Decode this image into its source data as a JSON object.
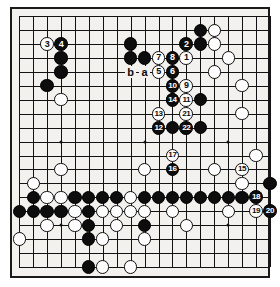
{
  "figure": {
    "kind": "go-board-diagram",
    "board_size": 19,
    "colors": {
      "board": "#f2f1ee",
      "line": "#121212",
      "black_stone": "#0d0d0d",
      "white_stone": "#fdfdfd",
      "black_marker_text": "#ffffff",
      "white_marker_text": "#0d0d0d"
    }
  },
  "hoshi": [
    {
      "c": 3,
      "r": 3
    },
    {
      "c": 9,
      "r": 3
    },
    {
      "c": 15,
      "r": 3
    },
    {
      "c": 3,
      "r": 9
    },
    {
      "c": 9,
      "r": 9
    },
    {
      "c": 15,
      "r": 9
    },
    {
      "c": 3,
      "r": 15
    },
    {
      "c": 9,
      "r": 15
    },
    {
      "c": 15,
      "r": 15
    }
  ],
  "stones": [
    {
      "c": 3,
      "r": 3,
      "color": "black"
    },
    {
      "c": 3,
      "r": 4,
      "color": "black"
    },
    {
      "c": 2,
      "r": 5,
      "color": "black"
    },
    {
      "c": 8,
      "r": 2,
      "color": "black"
    },
    {
      "c": 13,
      "r": 1,
      "color": "black"
    },
    {
      "c": 13,
      "r": 2,
      "color": "black"
    },
    {
      "c": 14,
      "r": 1,
      "color": "white"
    },
    {
      "c": 14,
      "r": 2,
      "color": "white"
    },
    {
      "c": 15,
      "r": 3,
      "color": "white"
    },
    {
      "c": 9,
      "r": 3,
      "color": "black"
    },
    {
      "c": 8,
      "r": 3,
      "color": "black"
    },
    {
      "c": 14,
      "r": 4,
      "color": "white"
    },
    {
      "c": 13,
      "r": 6,
      "color": "black"
    },
    {
      "c": 11,
      "r": 6,
      "color": "black"
    },
    {
      "c": 3,
      "r": 6,
      "color": "white"
    },
    {
      "c": 13,
      "r": 8,
      "color": "black"
    },
    {
      "c": 11,
      "r": 8,
      "color": "black"
    },
    {
      "c": 16,
      "r": 5,
      "color": "white"
    },
    {
      "c": 16,
      "r": 7,
      "color": "white"
    },
    {
      "c": 3,
      "r": 11,
      "color": "white"
    },
    {
      "c": 9,
      "r": 11,
      "color": "white"
    },
    {
      "c": 14,
      "r": 11,
      "color": "white"
    },
    {
      "c": 17,
      "r": 10,
      "color": "white"
    },
    {
      "c": 1,
      "r": 12,
      "color": "white"
    },
    {
      "c": 16,
      "r": 12,
      "color": "white"
    },
    {
      "c": 18,
      "r": 12,
      "color": "black"
    },
    {
      "c": 1,
      "r": 13,
      "color": "black"
    },
    {
      "c": 2,
      "r": 13,
      "color": "white"
    },
    {
      "c": 3,
      "r": 13,
      "color": "white"
    },
    {
      "c": 4,
      "r": 13,
      "color": "black"
    },
    {
      "c": 5,
      "r": 13,
      "color": "black"
    },
    {
      "c": 8,
      "r": 13,
      "color": "white"
    },
    {
      "c": 6,
      "r": 13,
      "color": "black"
    },
    {
      "c": 7,
      "r": 13,
      "color": "black"
    },
    {
      "c": 9,
      "r": 13,
      "color": "black"
    },
    {
      "c": 10,
      "r": 13,
      "color": "black"
    },
    {
      "c": 11,
      "r": 13,
      "color": "black"
    },
    {
      "c": 12,
      "r": 13,
      "color": "black"
    },
    {
      "c": 13,
      "r": 13,
      "color": "black"
    },
    {
      "c": 14,
      "r": 13,
      "color": "black"
    },
    {
      "c": 15,
      "r": 13,
      "color": "black"
    },
    {
      "c": 16,
      "r": 13,
      "color": "black"
    },
    {
      "c": 1,
      "r": 14,
      "color": "black"
    },
    {
      "c": 2,
      "r": 14,
      "color": "black"
    },
    {
      "c": 3,
      "r": 14,
      "color": "black"
    },
    {
      "c": 4,
      "r": 14,
      "color": "white"
    },
    {
      "c": 5,
      "r": 14,
      "color": "black"
    },
    {
      "c": 6,
      "r": 14,
      "color": "white"
    },
    {
      "c": 7,
      "r": 14,
      "color": "white"
    },
    {
      "c": 8,
      "r": 14,
      "color": "white"
    },
    {
      "c": 9,
      "r": 14,
      "color": "white"
    },
    {
      "c": 11,
      "r": 14,
      "color": "white"
    },
    {
      "c": 15,
      "r": 14,
      "color": "white"
    },
    {
      "c": 0,
      "r": 14,
      "color": "black"
    },
    {
      "c": 4,
      "r": 15,
      "color": "white"
    },
    {
      "c": 5,
      "r": 15,
      "color": "black"
    },
    {
      "c": 2,
      "r": 15,
      "color": "white"
    },
    {
      "c": 7,
      "r": 15,
      "color": "white"
    },
    {
      "c": 9,
      "r": 15,
      "color": "black"
    },
    {
      "c": 12,
      "r": 15,
      "color": "white"
    },
    {
      "c": 5,
      "r": 16,
      "color": "black"
    },
    {
      "c": 6,
      "r": 16,
      "color": "white"
    },
    {
      "c": 0,
      "r": 16,
      "color": "white"
    },
    {
      "c": 9,
      "r": 16,
      "color": "white"
    },
    {
      "c": 5,
      "r": 18,
      "color": "black"
    },
    {
      "c": 6,
      "r": 18,
      "color": "white"
    },
    {
      "c": 8,
      "r": 18,
      "color": "white"
    }
  ],
  "moves": [
    {
      "n": "1",
      "c": 12,
      "r": 3,
      "color": "white"
    },
    {
      "n": "2",
      "c": 12,
      "r": 2,
      "color": "black"
    },
    {
      "n": "3",
      "c": 2,
      "r": 2,
      "color": "white"
    },
    {
      "n": "4",
      "c": 3,
      "r": 2,
      "color": "black"
    },
    {
      "n": "5",
      "c": 10,
      "r": 4,
      "color": "white"
    },
    {
      "n": "6",
      "c": 11,
      "r": 4,
      "color": "black"
    },
    {
      "n": "7",
      "c": 10,
      "r": 3,
      "color": "white"
    },
    {
      "n": "8",
      "c": 11,
      "r": 3,
      "color": "black"
    },
    {
      "n": "9",
      "c": 12,
      "r": 5,
      "color": "white"
    },
    {
      "n": "10",
      "c": 11,
      "r": 5,
      "color": "black"
    },
    {
      "n": "11",
      "c": 12,
      "r": 6,
      "color": "white"
    },
    {
      "n": "12",
      "c": 10,
      "r": 8,
      "color": "black"
    },
    {
      "n": "13",
      "c": 10,
      "r": 7,
      "color": "white"
    },
    {
      "n": "14",
      "c": 11,
      "r": 6,
      "color": "black"
    },
    {
      "n": "15",
      "c": 16,
      "r": 11,
      "color": "white"
    },
    {
      "n": "16",
      "c": 11,
      "r": 11,
      "color": "black"
    },
    {
      "n": "17",
      "c": 11,
      "r": 10,
      "color": "white"
    },
    {
      "n": "18",
      "c": 17,
      "r": 13,
      "color": "black"
    },
    {
      "n": "19",
      "c": 17,
      "r": 14,
      "color": "white"
    },
    {
      "n": "20",
      "c": 18,
      "r": 14,
      "color": "black"
    },
    {
      "n": "21",
      "c": 12,
      "r": 7,
      "color": "white"
    },
    {
      "n": "22",
      "c": 12,
      "r": 8,
      "color": "black"
    }
  ],
  "point_labels": [
    {
      "text": "b",
      "c": 8,
      "r": 4
    },
    {
      "text": "a",
      "c": 9,
      "r": 4
    }
  ]
}
